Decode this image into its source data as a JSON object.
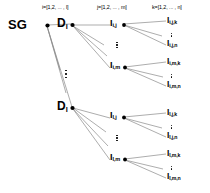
{
  "diagram": {
    "type": "tree",
    "background_color": "#ffffff",
    "edge_color": "#808080",
    "node_color": "#000000",
    "text_color": "#000000",
    "column_headers": [
      {
        "id": "level-i",
        "text": "i=[1,2, ... , l]",
        "x": 43,
        "y": 7
      },
      {
        "id": "level-j",
        "text": "j=[1,2, ... , m]",
        "x": 98,
        "y": 7
      },
      {
        "id": "level-k",
        "text": "k=[1,2, ... , n]",
        "x": 153,
        "y": 7
      }
    ],
    "nodes": {
      "root": {
        "id": "SG",
        "label": "SG",
        "sub": "",
        "x": 32,
        "y": 24
      },
      "level1": [
        {
          "id": "D_i",
          "label": "D",
          "sub": "i",
          "x": 62,
          "y": 24
        },
        {
          "id": "D_l",
          "label": "D",
          "sub": "l",
          "x": 62,
          "y": 107
        }
      ],
      "level2": [
        {
          "id": "I_i_j",
          "label": "I",
          "sub": "i,j",
          "x": 113,
          "y": 25
        },
        {
          "id": "I_i_m",
          "label": "I",
          "sub": "i,m",
          "x": 113,
          "y": 68
        },
        {
          "id": "I_l_j",
          "label": "I",
          "sub": "l,j",
          "x": 113,
          "y": 118
        },
        {
          "id": "I_l_m",
          "label": "I",
          "sub": "l,m",
          "x": 113,
          "y": 160
        }
      ],
      "level3": [
        {
          "id": "I_i_j_k",
          "label": "I",
          "sub": "i,j,k",
          "x": 169,
          "y": 22
        },
        {
          "id": "I_i_j_n",
          "label": "I",
          "sub": "i,j,n",
          "x": 169,
          "y": 45
        },
        {
          "id": "I_i_m_k",
          "label": "I",
          "sub": "i,m,k",
          "x": 169,
          "y": 63
        },
        {
          "id": "I_i_m_n",
          "label": "I",
          "sub": "i,m,n",
          "x": 169,
          "y": 86
        },
        {
          "id": "I_l_j_k",
          "label": "I",
          "sub": "l,j,k",
          "x": 169,
          "y": 114
        },
        {
          "id": "I_l_j_n",
          "label": "I",
          "sub": "l,j,n",
          "x": 169,
          "y": 137
        },
        {
          "id": "I_l_m_k",
          "label": "I",
          "sub": "l,m,k",
          "x": 169,
          "y": 155
        },
        {
          "id": "I_l_m_n",
          "label": "I",
          "sub": "l,m,n",
          "x": 169,
          "y": 178
        }
      ]
    },
    "ellipses": [
      {
        "id": "ellipsis-d",
        "x": 67,
        "y": 72
      },
      {
        "id": "ellipsis-i-top",
        "x": 117,
        "y": 44
      },
      {
        "id": "ellipsis-i-bottom",
        "x": 117,
        "y": 137
      },
      {
        "id": "ellipsis-k-1",
        "x": 171,
        "y": 34
      },
      {
        "id": "ellipsis-k-2",
        "x": 171,
        "y": 75
      },
      {
        "id": "ellipsis-k-3",
        "x": 171,
        "y": 126
      },
      {
        "id": "ellipsis-k-4",
        "x": 171,
        "y": 167
      }
    ]
  }
}
